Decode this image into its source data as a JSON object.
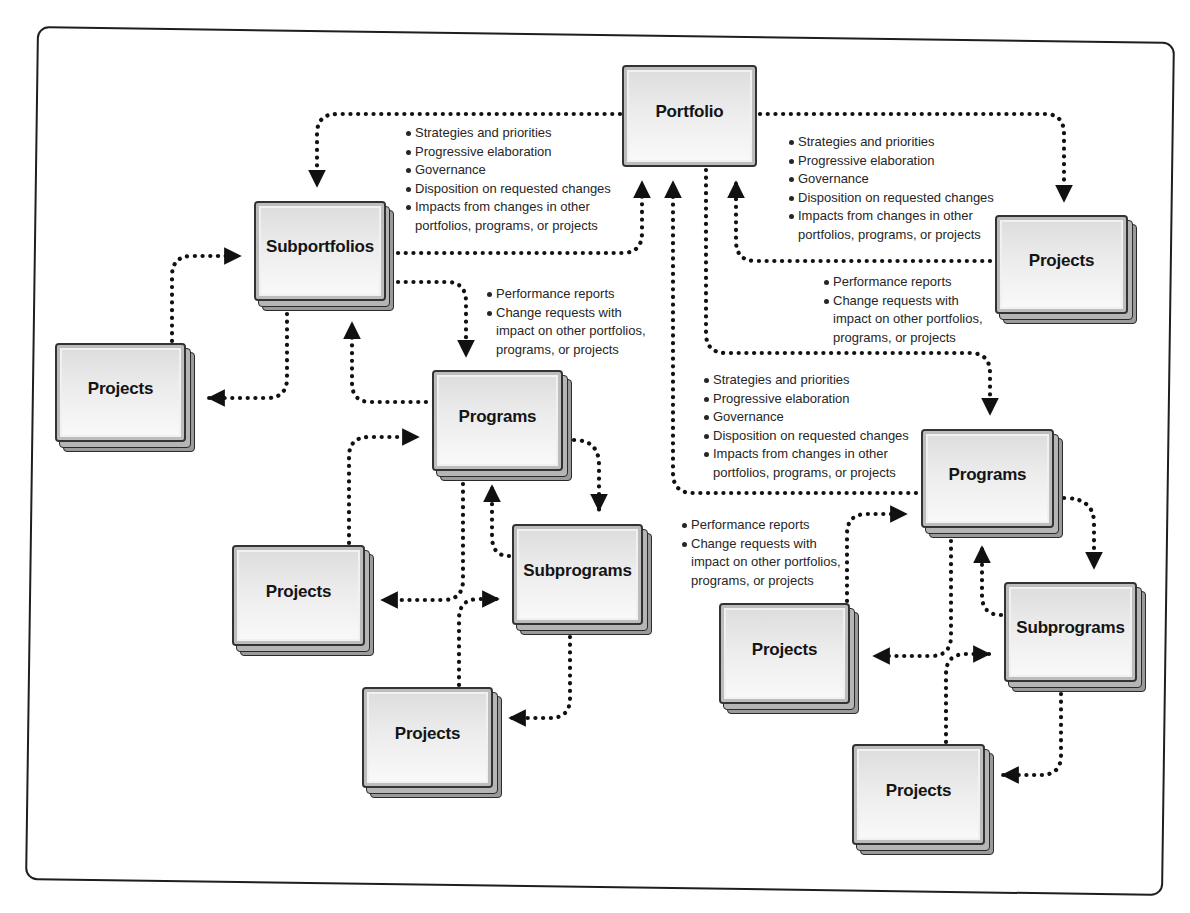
{
  "diagram": {
    "nodes": {
      "portfolio": {
        "label": "Portfolio"
      },
      "subportfolios": {
        "label": "Subportfolios"
      },
      "projects_left": {
        "label": "Projects"
      },
      "programs_left": {
        "label": "Programs"
      },
      "subprograms_left": {
        "label": "Subprograms"
      },
      "projects_left_mid": {
        "label": "Projects"
      },
      "projects_left_bottom": {
        "label": "Projects"
      },
      "projects_top_right": {
        "label": "Projects"
      },
      "programs_right": {
        "label": "Programs"
      },
      "subprograms_right": {
        "label": "Subprograms"
      },
      "projects_right_mid": {
        "label": "Projects"
      },
      "projects_right_bottom": {
        "label": "Projects"
      }
    },
    "annotations": {
      "downward_left": {
        "items": [
          "Strategies and priorities",
          "Progressive elaboration",
          "Governance",
          "Disposition on requested changes",
          "Impacts from changes in other",
          "portfolios, programs, or projects"
        ]
      },
      "downward_top_right": {
        "items": [
          "Strategies and priorities",
          "Progressive elaboration",
          "Governance",
          "Disposition on requested changes",
          "Impacts from changes in other",
          "portfolios, programs, or projects"
        ]
      },
      "upward_top_right": {
        "items": [
          "Performance reports",
          "Change requests with",
          "impact on other portfolios,",
          "programs, or projects"
        ]
      },
      "upward_left": {
        "items": [
          "Performance reports",
          "Change requests with",
          "impact on other portfolios,",
          "programs, or projects"
        ]
      },
      "downward_center": {
        "items": [
          "Strategies and priorities",
          "Progressive elaboration",
          "Governance",
          "Disposition on requested changes",
          "Impacts from changes in other",
          "portfolios, programs, or projects"
        ]
      },
      "upward_center": {
        "items": [
          "Performance reports",
          "Change requests with",
          "impact on other portfolios,",
          "programs, or projects"
        ]
      }
    },
    "colors": {
      "line": "#111111",
      "box_border": "#333333",
      "box_fill": "#ececec",
      "text": "#262626"
    }
  }
}
